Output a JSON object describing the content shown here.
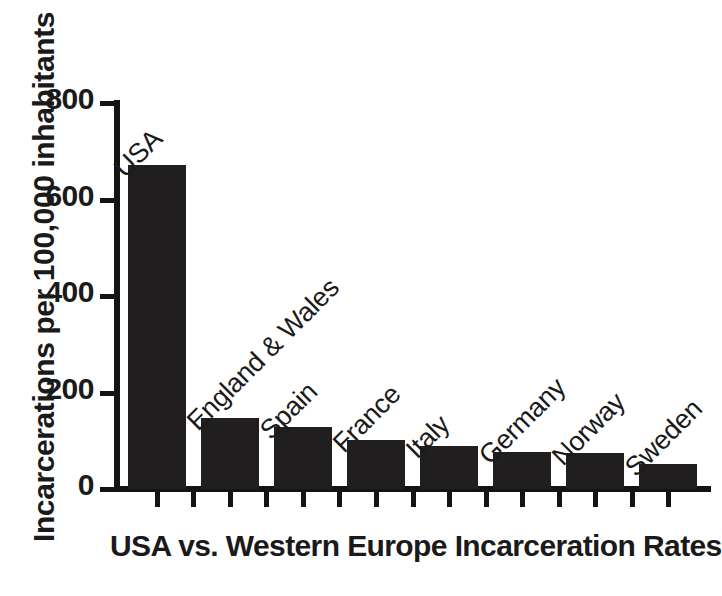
{
  "chart_data": {
    "type": "bar",
    "title": "USA vs. Western Europe Incarceration Rates",
    "xlabel": "",
    "ylabel": "Incarcerations per 100,000 inhabitants",
    "categories": [
      "USA",
      "England & Wales",
      "Spain",
      "France",
      "Italy",
      "Germany",
      "Norway",
      "Sweden"
    ],
    "values": [
      672,
      147,
      128,
      102,
      89,
      77,
      75,
      52
    ],
    "ylim": [
      0,
      800
    ],
    "yticks": [
      0,
      200,
      400,
      600,
      800
    ],
    "ytick_labels": [
      "0",
      "200",
      "400",
      "600",
      "800"
    ],
    "grid": false,
    "legend": false,
    "bar_color": "#201e1e",
    "axis_color": "#141414",
    "background": "#ffffff",
    "label_rotation_deg": 45
  },
  "axis": {
    "y_title": "Incarcerations per 100,000 inhabitants"
  },
  "caption": {
    "text": "USA vs. Western Europe Incarceration Rates"
  }
}
